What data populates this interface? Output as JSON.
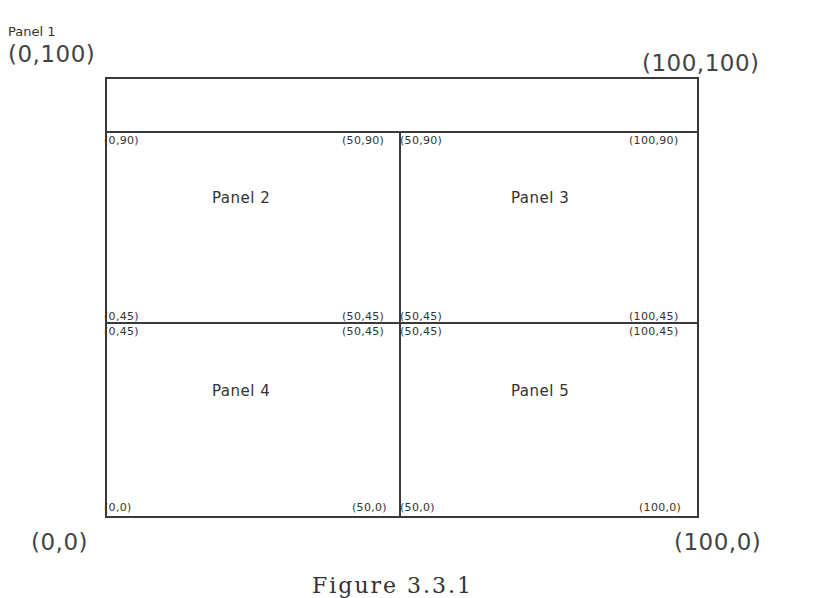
{
  "title": "Panel 1",
  "outer_corners": {
    "top_left": "(0,100)",
    "top_right": "(100,100)",
    "bottom_left": "(0,0)",
    "bottom_right": "(100,0)"
  },
  "panels": [
    {
      "label": "Panel 2",
      "corners": {
        "tl": "(0,90)",
        "tr": "(50,90)",
        "bl": "(0,45)",
        "br": "(50,45)"
      }
    },
    {
      "label": "Panel 3",
      "corners": {
        "tl": "(50,90)",
        "tr": "(100,90)",
        "bl": "(50,45)",
        "br": "(100,45)"
      }
    },
    {
      "label": "Panel 4",
      "corners": {
        "tl": "(0,45)",
        "tr": "(50,45)",
        "bl": "(0,0)",
        "br": "(50,0)"
      }
    },
    {
      "label": "Panel 5",
      "corners": {
        "tl": "(50,45)",
        "tr": "(100,45)",
        "bl": "(50,0)",
        "br": "(100,0)"
      }
    }
  ],
  "caption": "Figure 3.3.1"
}
